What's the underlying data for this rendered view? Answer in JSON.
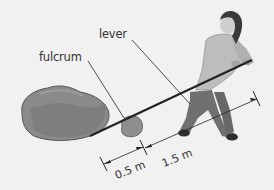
{
  "diagram": {
    "type": "lever-illustration",
    "labels": {
      "lever": "lever",
      "fulcrum": "fulcrum"
    },
    "dimensions": {
      "load_arm": "0.5 m",
      "effort_arm": "1.5 m"
    },
    "objects": [
      "rock",
      "fulcrum-stone",
      "lever-bar",
      "person"
    ],
    "colors": {
      "background": "#f1f1f1",
      "rock": "#8a8a8a",
      "rock_shade": "#6e6e6e",
      "line": "#222222",
      "shirt": "#bdbdbd",
      "trousers": "#707070",
      "hair": "#3a3a3a",
      "skin": "#cfcfcf"
    }
  }
}
